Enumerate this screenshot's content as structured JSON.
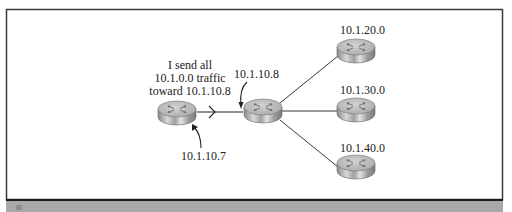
{
  "diagram": {
    "type": "network-routing",
    "annotation": {
      "lines": [
        "I send all",
        "10.1.0.0 traffic",
        "toward 10.1.10.8"
      ]
    },
    "routers": [
      {
        "id": "source-router",
        "interface_label": "10.1.10.7"
      },
      {
        "id": "hub-router",
        "interface_label": "10.1.10.8"
      },
      {
        "id": "net-20",
        "network_label": "10.1.20.0"
      },
      {
        "id": "net-30",
        "network_label": "10.1.30.0"
      },
      {
        "id": "net-40",
        "network_label": "10.1.40.0"
      }
    ],
    "links": [
      {
        "from": "source-router",
        "to": "hub-router",
        "directional": true
      },
      {
        "from": "hub-router",
        "to": "net-20"
      },
      {
        "from": "hub-router",
        "to": "net-30"
      },
      {
        "from": "hub-router",
        "to": "net-40"
      }
    ],
    "colors": {
      "frame": "#3a3a3a",
      "caption_bar": "#a8a8a8",
      "router_top": "#b9b9b9",
      "router_side": "#9a9a9a",
      "line": "#222222"
    }
  },
  "caption": {
    "text": ""
  }
}
